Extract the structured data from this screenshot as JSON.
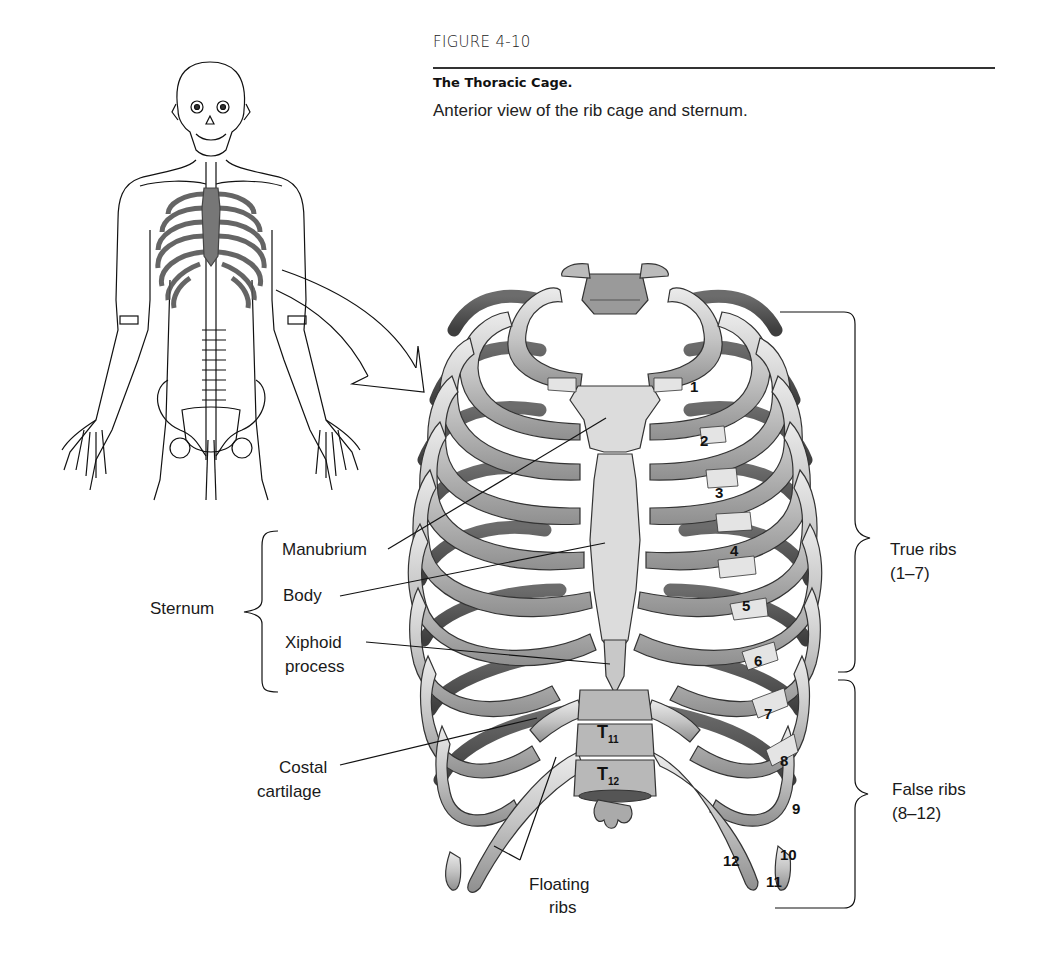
{
  "figure": {
    "number": "FIGURE 4-10",
    "title": "The Thoracic Cage.",
    "caption": "Anterior view of the rib cage and sternum."
  },
  "labels": {
    "sternum": "Sternum",
    "manubrium": "Manubrium",
    "body": "Body",
    "xiphoid_1": "Xiphoid",
    "xiphoid_2": "process",
    "costal_1": "Costal",
    "costal_2": "cartilage",
    "floating_1": "Floating",
    "floating_2": "ribs",
    "true_ribs_1": "True ribs",
    "true_ribs_2": "(1–7)",
    "false_ribs_1": "False ribs",
    "false_ribs_2": "(8–12)"
  },
  "rib_numbers": [
    "1",
    "2",
    "3",
    "4",
    "5",
    "6",
    "7",
    "8",
    "9",
    "10",
    "11",
    "12"
  ],
  "vertebrae": {
    "t11": "T",
    "t11_sub": "11",
    "t12": "T",
    "t12_sub": "12"
  },
  "colors": {
    "bone": "#d6d6d6",
    "bone_shadow": "#8a8a8a",
    "cartilage": "#e6e6e6",
    "highlight_gray": "#808080",
    "line": "#111111"
  }
}
